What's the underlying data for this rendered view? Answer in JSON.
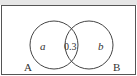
{
  "diagram": {
    "type": "venn",
    "sets": [
      {
        "name": "A",
        "region_label": "a"
      },
      {
        "name": "B",
        "region_label": "b"
      }
    ],
    "intersection_label": "0.3"
  }
}
